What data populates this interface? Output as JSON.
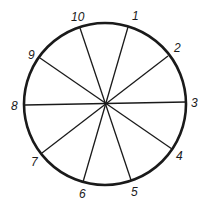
{
  "diagram": {
    "type": "circle-with-diameters",
    "center": [
      105,
      104
    ],
    "radius": 81,
    "stroke_color": "#1a1a1a",
    "points": [
      {
        "label": "1",
        "x": 128,
        "y": 27,
        "lx": 132,
        "ly": 20
      },
      {
        "label": "2",
        "x": 168,
        "y": 56,
        "lx": 174,
        "ly": 52
      },
      {
        "label": "3",
        "x": 186,
        "y": 102,
        "lx": 191,
        "ly": 107
      },
      {
        "label": "4",
        "x": 172,
        "y": 149,
        "lx": 176,
        "ly": 160
      },
      {
        "label": "5",
        "x": 131,
        "y": 180,
        "lx": 131,
        "ly": 196
      },
      {
        "label": "6",
        "x": 83,
        "y": 182,
        "lx": 79,
        "ly": 198
      },
      {
        "label": "7",
        "x": 42,
        "y": 153,
        "lx": 31,
        "ly": 166
      },
      {
        "label": "8",
        "x": 25,
        "y": 105,
        "lx": 11,
        "ly": 110
      },
      {
        "label": "9",
        "x": 40,
        "y": 58,
        "lx": 28,
        "ly": 59
      },
      {
        "label": "10",
        "x": 80,
        "y": 28,
        "lx": 71,
        "ly": 21
      }
    ],
    "diameters": [
      [
        "1",
        "6"
      ],
      [
        "2",
        "7"
      ],
      [
        "3",
        "8"
      ],
      [
        "4",
        "9"
      ],
      [
        "5",
        "10"
      ]
    ]
  }
}
